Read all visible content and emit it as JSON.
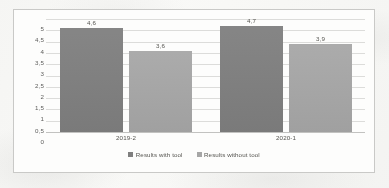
{
  "chart_data": {
    "type": "bar",
    "title": "",
    "subtitle": "",
    "xlabel": "",
    "ylabel": "",
    "categories": [
      "2019-2",
      "2020-1"
    ],
    "series": [
      {
        "name": "Results with tool",
        "color": "#7f7f7f",
        "values": [
          4.6,
          4.7
        ],
        "labels": [
          "4,6",
          "4,7"
        ]
      },
      {
        "name": "Results without tool",
        "color": "#a6a6a6",
        "values": [
          3.6,
          3.9
        ],
        "labels": [
          "3,6",
          "3,9"
        ]
      }
    ],
    "ylim": [
      0,
      5
    ],
    "ytick_values": [
      5,
      4.5,
      4,
      3.5,
      3,
      2.5,
      2,
      1.5,
      1,
      0.5,
      0
    ],
    "ytick_labels": [
      "5",
      "4,5",
      "4",
      "3,5",
      "3",
      "2,5",
      "2",
      "1,5",
      "1",
      "0,5",
      "0"
    ],
    "decimal_separator": ",",
    "grid": true,
    "grid_axis": "y",
    "legend_position": "bottom",
    "data_labels_shown": true,
    "frame_border_color": "#c9c9c7",
    "gridline_color": "#dcdcda",
    "plot_background": "#fdfdfc"
  }
}
